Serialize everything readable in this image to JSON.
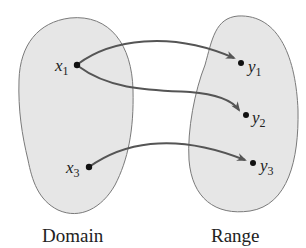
{
  "diagram": {
    "type": "function-mapping",
    "domain": {
      "label": "Domain",
      "elements": [
        {
          "name": "x",
          "subscript": "1"
        },
        {
          "name": "x",
          "subscript": "3"
        }
      ]
    },
    "range": {
      "label": "Range",
      "elements": [
        {
          "name": "y",
          "subscript": "1"
        },
        {
          "name": "y",
          "subscript": "2"
        },
        {
          "name": "y",
          "subscript": "3"
        }
      ]
    },
    "mappings": [
      {
        "from": "x1",
        "to": "y1"
      },
      {
        "from": "x1",
        "to": "y2"
      },
      {
        "from": "x3",
        "to": "y3"
      }
    ],
    "colors": {
      "blob_fill": "#e6e6e6",
      "blob_stroke": "#7a7a7a",
      "arrow": "#555555",
      "dot": "#111111"
    }
  }
}
